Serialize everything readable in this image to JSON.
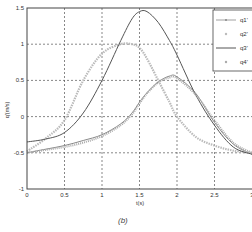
{
  "caption": "(b)",
  "chart_data": {
    "type": "line",
    "title": "",
    "xlabel": "t(s)",
    "ylabel": "q'(m/s)",
    "xlim": [
      0,
      3
    ],
    "ylim": [
      -1,
      1.5
    ],
    "xticks": [
      "0",
      "0.5",
      "1",
      "1.5",
      "2",
      "2.5",
      "3"
    ],
    "yticks": [
      "-1",
      "-0.5",
      "0",
      "0.5",
      "1",
      "1.5"
    ],
    "grid": true,
    "legend_position": "upper right",
    "x": [
      0,
      0.25,
      0.5,
      0.75,
      1.0,
      1.25,
      1.4,
      1.5,
      1.6,
      1.75,
      1.9,
      2.0,
      2.25,
      2.5,
      2.75,
      3.0
    ],
    "series": [
      {
        "name": "q1'",
        "style": "line with dot markers",
        "color": "#888888",
        "values": [
          -0.5,
          -0.45,
          -0.4,
          -0.33,
          -0.25,
          -0.1,
          0.05,
          0.2,
          0.33,
          0.48,
          0.56,
          0.55,
          0.32,
          -0.08,
          -0.38,
          -0.52
        ]
      },
      {
        "name": "q2'",
        "style": "x markers",
        "color": "#bbbbbb",
        "values": [
          -0.48,
          -0.3,
          -0.05,
          0.5,
          0.87,
          1.0,
          1.0,
          0.95,
          0.8,
          0.5,
          0.2,
          0.0,
          -0.28,
          -0.4,
          -0.47,
          -0.5
        ]
      },
      {
        "name": "q3'",
        "style": "solid line",
        "color": "#555555",
        "values": [
          -0.35,
          -0.31,
          -0.22,
          0.05,
          0.5,
          1.05,
          1.35,
          1.45,
          1.45,
          1.3,
          1.05,
          0.85,
          0.3,
          -0.12,
          -0.42,
          -0.52
        ]
      },
      {
        "name": "q4'",
        "style": "dot markers",
        "color": "#aaaaaa",
        "values": [
          -0.5,
          -0.46,
          -0.42,
          -0.36,
          -0.27,
          -0.12,
          0.03,
          0.18,
          0.32,
          0.47,
          0.54,
          0.53,
          0.3,
          -0.05,
          -0.36,
          -0.5
        ]
      }
    ]
  }
}
